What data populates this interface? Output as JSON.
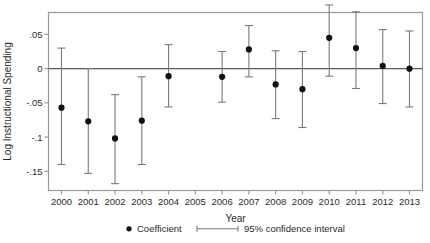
{
  "chart_data": {
    "type": "scatter",
    "title": "",
    "xlabel": "Year",
    "ylabel": "Log Instructional Spending",
    "categories": [
      "2000",
      "2001",
      "2002",
      "2003",
      "2004",
      "2005",
      "2006",
      "2007",
      "2008",
      "2009",
      "2010",
      "2011",
      "2012",
      "2013"
    ],
    "xtick_labels": [
      "2000",
      "2001",
      "2002",
      "2003",
      "2004",
      "2005",
      "2006",
      "2007",
      "2008",
      "2009",
      "2010",
      "2011",
      "2012",
      "2013"
    ],
    "ytick_labels": [
      ".05",
      "0",
      "-.05",
      "-.1",
      "-.15"
    ],
    "ytick_values": [
      0.05,
      0,
      -0.05,
      -0.1,
      -0.15
    ],
    "ylim": [
      -0.178,
      0.082
    ],
    "grid": false,
    "reference_line": 0,
    "series": [
      {
        "name": "Coefficient",
        "x": [
          "2000",
          "2001",
          "2002",
          "2003",
          "2004",
          "2005",
          "2006",
          "2007",
          "2008",
          "2009",
          "2010",
          "2011",
          "2012",
          "2013"
        ],
        "values": [
          -0.057,
          -0.077,
          -0.102,
          -0.076,
          -0.011,
          null,
          -0.012,
          0.028,
          -0.023,
          -0.03,
          0.045,
          0.03,
          0.004,
          0.0
        ],
        "ci_low": [
          -0.14,
          -0.153,
          -0.168,
          -0.14,
          -0.056,
          null,
          -0.049,
          -0.012,
          -0.073,
          -0.086,
          -0.011,
          -0.029,
          -0.051,
          -0.056
        ],
        "ci_high": [
          0.03,
          0.0,
          -0.038,
          -0.012,
          0.035,
          null,
          0.025,
          0.063,
          0.026,
          0.025,
          0.093,
          0.083,
          0.057,
          0.055
        ]
      }
    ],
    "legend": {
      "position": "bottom",
      "entries": [
        {
          "label": "Coefficient",
          "marker": "dot"
        },
        {
          "label": "95% confidence interval",
          "marker": "errorbar"
        }
      ]
    },
    "colors": {
      "marker": "#111111",
      "errorbar": "#7a7a7a",
      "frame": "#9a9a9a",
      "zeroline": "#5a5a5a",
      "text": "#2b2b2b"
    }
  }
}
